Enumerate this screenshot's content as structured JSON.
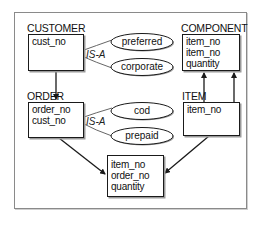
{
  "diagram": {
    "entities": [
      {
        "id": "customer",
        "name": "CUSTOMER",
        "attributes": [
          "cust_no"
        ]
      },
      {
        "id": "order",
        "name": "ORDER",
        "attributes": [
          "order_no",
          "cust_no"
        ]
      },
      {
        "id": "component",
        "name": "COMPONENT",
        "attributes": [
          "item_no",
          "item_no",
          "quantity"
        ]
      },
      {
        "id": "item",
        "name": "ITEM",
        "attributes": [
          "item_no"
        ]
      },
      {
        "id": "order_item",
        "name": "",
        "attributes": [
          "item_no",
          "order_no",
          "quantity"
        ]
      }
    ],
    "subtypes": [
      {
        "parent": "CUSTOMER",
        "relation": "IS-A",
        "children": [
          "preferred",
          "corporate"
        ]
      },
      {
        "parent": "ORDER",
        "relation": "IS-A",
        "children": [
          "cod",
          "prepaid"
        ]
      }
    ],
    "relationships": [
      {
        "from": "CUSTOMER",
        "to": "ORDER"
      },
      {
        "from": "ORDER",
        "to": "order_item"
      },
      {
        "from": "ITEM",
        "to": "order_item"
      },
      {
        "from": "ITEM",
        "to": "COMPONENT"
      },
      {
        "from": "ITEM",
        "to": "COMPONENT"
      }
    ]
  },
  "colors": {
    "line": "#1a1a1a",
    "frame": "#8a8a8a",
    "shadow": "#9a9a9a"
  }
}
